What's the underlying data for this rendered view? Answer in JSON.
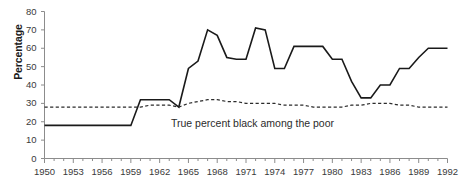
{
  "chart_data": {
    "type": "line",
    "title": "",
    "xlabel": "",
    "ylabel": "Percentage",
    "xlim": [
      1950,
      1992
    ],
    "ylim": [
      0,
      80
    ],
    "grid": false,
    "legend_position": "none",
    "yticks": [
      0,
      10,
      20,
      30,
      40,
      50,
      60,
      70,
      80
    ],
    "xticks": [
      1950,
      1953,
      1956,
      1959,
      1962,
      1965,
      1968,
      1971,
      1974,
      1977,
      1980,
      1983,
      1986,
      1989,
      1992
    ],
    "xtick_minor_step": 1,
    "x": [
      1950,
      1951,
      1952,
      1953,
      1954,
      1955,
      1956,
      1957,
      1958,
      1959,
      1960,
      1961,
      1962,
      1963,
      1964,
      1965,
      1966,
      1967,
      1968,
      1969,
      1970,
      1971,
      1972,
      1973,
      1974,
      1975,
      1976,
      1977,
      1978,
      1979,
      1980,
      1981,
      1982,
      1983,
      1984,
      1985,
      1986,
      1987,
      1988,
      1989,
      1990,
      1991,
      1992
    ],
    "series": [
      {
        "name": "Percent black in poverty coverage",
        "style": "solid",
        "color": "#1a1a1a",
        "values": [
          18,
          18,
          18,
          18,
          18,
          18,
          18,
          18,
          18,
          18,
          32,
          32,
          32,
          32,
          28,
          49,
          53,
          70,
          67,
          55,
          54,
          54,
          71,
          70,
          49,
          49,
          61,
          61,
          61,
          61,
          54,
          54,
          42,
          33,
          33,
          40,
          40,
          49,
          49,
          55,
          60,
          60,
          60
        ]
      },
      {
        "name": "True percent black among the poor",
        "style": "dashed",
        "color": "#2b2b2b",
        "values": [
          28,
          28,
          28,
          28,
          28,
          28,
          28,
          28,
          28,
          28,
          28,
          29,
          29,
          29,
          28,
          30,
          31,
          32,
          32,
          31,
          31,
          30,
          30,
          30,
          30,
          29,
          29,
          29,
          28,
          28,
          28,
          28,
          29,
          29,
          30,
          30,
          30,
          29,
          29,
          28,
          28,
          28,
          28
        ]
      }
    ],
    "annotations": [
      {
        "text": "True percent black among the poor",
        "x": 1971,
        "y": 19
      }
    ]
  },
  "axis": {
    "y_title": "Percentage",
    "y_tick_labels": [
      "80",
      "70",
      "60",
      "50",
      "40",
      "30",
      "20",
      "10",
      "0"
    ],
    "x_tick_labels": [
      "1950",
      "1953",
      "1956",
      "1959",
      "1962",
      "1965",
      "1968",
      "1971",
      "1974",
      "1977",
      "1980",
      "1983",
      "1986",
      "1989",
      "1992"
    ]
  },
  "annotation": {
    "poor_label": "True percent black among the poor"
  },
  "colors": {
    "line_primary": "#1a1a1a",
    "line_secondary": "#2b2b2b",
    "axis": "#8c8c8c",
    "text": "#3a3a3a",
    "background": "#ffffff"
  }
}
